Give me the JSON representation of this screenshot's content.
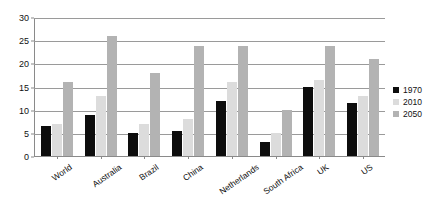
{
  "chart_data": {
    "type": "bar",
    "title": "",
    "subtitle": "",
    "xlabel": "",
    "ylabel": "",
    "ylim": [
      0,
      30
    ],
    "yticks": [
      0,
      5,
      10,
      15,
      20,
      25,
      30
    ],
    "ytick_labels": [
      "0",
      "5",
      "10",
      "15",
      "20",
      "25",
      "30"
    ],
    "grid": "horizontal",
    "legend_position": "right",
    "categories": [
      "World",
      "Australia",
      "Brazil",
      "China",
      "Netherlands",
      "South Africa",
      "UK",
      "US"
    ],
    "series": [
      {
        "name": "1970",
        "color": "#0d0d0d",
        "values": [
          6.5,
          9,
          5,
          5.5,
          12,
          3,
          15,
          11.5
        ]
      },
      {
        "name": "2010",
        "color": "#dcdcdc",
        "values": [
          7,
          13,
          7,
          8,
          16,
          5,
          16.5,
          13
        ]
      },
      {
        "name": "2050",
        "color": "#b3b3b3",
        "values": [
          16,
          26,
          18,
          24,
          24,
          10,
          24,
          21
        ]
      }
    ]
  },
  "legend": {
    "items": [
      {
        "label": "1970"
      },
      {
        "label": "2010"
      },
      {
        "label": "2050"
      }
    ]
  },
  "colors": {
    "series_1970": "#0d0d0d",
    "series_2010": "#dcdcdc",
    "series_2050": "#b3b3b3",
    "axis": "#8a8a8a",
    "gridline": "#9a9a9a",
    "background": "#ffffff",
    "text": "#111111"
  }
}
